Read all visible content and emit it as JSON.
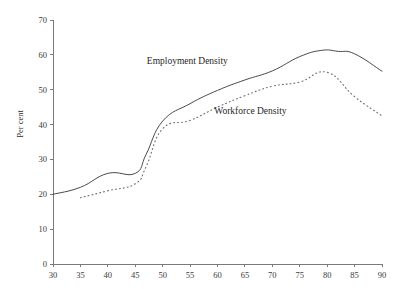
{
  "chart_data": {
    "type": "line",
    "title": "",
    "xlabel": "",
    "ylabel": "Per cent",
    "xlim": [
      30,
      90
    ],
    "ylim": [
      0,
      70
    ],
    "xticks": [
      30,
      35,
      40,
      45,
      50,
      55,
      60,
      65,
      70,
      75,
      80,
      85,
      90
    ],
    "xtick_labels": [
      "30",
      "35",
      "40",
      "45",
      "50",
      "55",
      "60",
      "65",
      "70",
      "75",
      "80",
      "85",
      "90"
    ],
    "yticks": [
      0,
      10,
      20,
      30,
      40,
      50,
      60,
      70
    ],
    "ytick_labels": [
      "0",
      "10",
      "20",
      "30",
      "40",
      "50",
      "60",
      "70"
    ],
    "grid": false,
    "legend_position": "inline-annotations",
    "x": [
      30,
      35,
      40,
      45,
      47,
      50,
      55,
      60,
      65,
      70,
      75,
      80,
      85,
      90
    ],
    "series": [
      {
        "name": "Employment Density",
        "style": "solid",
        "color": "#4a4a4a",
        "x": [
          30,
          35,
          40,
          45,
          47,
          50,
          55,
          60,
          65,
          70,
          75,
          79,
          82,
          85,
          90
        ],
        "values": [
          20.0,
          22.0,
          26.0,
          26.0,
          31.5,
          41.0,
          46.0,
          49.8,
          52.8,
          55.4,
          59.5,
          61.3,
          61.0,
          60.3,
          55.3
        ]
      },
      {
        "name": "Workforce Density",
        "style": "dotted",
        "color": "#6a6a6a",
        "x": [
          35,
          40,
          45,
          47,
          50,
          55,
          60,
          65,
          70,
          75,
          80,
          85,
          90
        ],
        "values": [
          19.0,
          21.0,
          23.0,
          28.0,
          38.8,
          41.2,
          45.0,
          48.3,
          51.0,
          52.2,
          55.0,
          48.0,
          42.5
        ]
      }
    ],
    "annotations": [
      {
        "text": "Employment Density",
        "x": 54.5,
        "y": 57.5,
        "series": "Employment Density"
      },
      {
        "text": "Workforce Density",
        "x": 66.0,
        "y": 43.0,
        "series": "Workforce Density"
      }
    ]
  }
}
